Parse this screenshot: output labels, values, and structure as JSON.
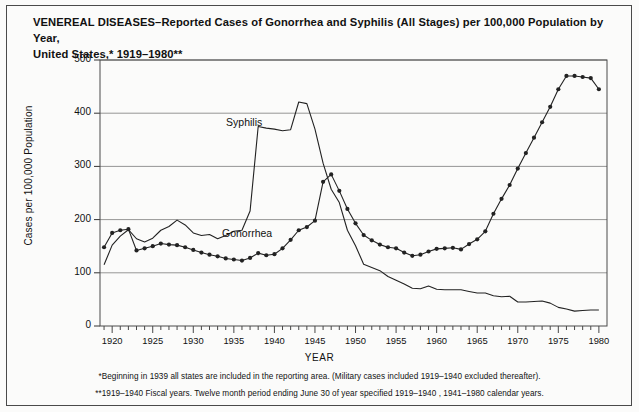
{
  "figure": {
    "title_line1": "VENEREAL DISEASES–Reported Cases of Gonorrhea and Syphilis (All Stages) per 100,000 Population by Year,",
    "title_line2": "United States,* 1919–1980**",
    "footnote1": "*Beginning in 1939 all states are included in the reporting area. (Military cases included 1919–1940 excluded thereafter).",
    "footnote2": "**1919–1940 Fiscal years. Twelve month period ending June 30 of year specified 1919–1940 , 1941–1980 calendar years.",
    "line_color": "#222222",
    "grid_color": "#8a8a8a",
    "frame_color": "#4a4a4a"
  },
  "chart_data": {
    "type": "line",
    "title": "VENEREAL DISEASES–Reported Cases of Gonorrhea and Syphilis (All Stages) per 100,000 Population by Year, United States,* 1919–1980**",
    "xlabel": "YEAR",
    "ylabel": "Cases per 100,000 Population",
    "xlim": [
      1918.5,
      1981
    ],
    "ylim": [
      0,
      500
    ],
    "yticks": [
      0,
      100,
      200,
      300,
      400,
      500
    ],
    "xticks": [
      1920,
      1925,
      1930,
      1935,
      1940,
      1945,
      1950,
      1955,
      1960,
      1965,
      1970,
      1975,
      1980
    ],
    "xtick_minor_step": 1,
    "grid": "horizontal",
    "legend": "inline-annotations",
    "annotations": [
      {
        "text": "Syphilis",
        "x": 1937.0,
        "y": 382
      },
      {
        "text": "Gonorrhea",
        "x": 1936.5,
        "y": 172
      }
    ],
    "x": [
      1919,
      1920,
      1921,
      1922,
      1923,
      1924,
      1925,
      1926,
      1927,
      1928,
      1929,
      1930,
      1931,
      1932,
      1933,
      1934,
      1935,
      1936,
      1937,
      1938,
      1939,
      1940,
      1941,
      1942,
      1943,
      1944,
      1945,
      1946,
      1947,
      1948,
      1949,
      1950,
      1951,
      1952,
      1953,
      1954,
      1955,
      1956,
      1957,
      1958,
      1959,
      1960,
      1961,
      1962,
      1963,
      1964,
      1965,
      1966,
      1967,
      1968,
      1969,
      1970,
      1971,
      1972,
      1973,
      1974,
      1975,
      1976,
      1977,
      1978,
      1979,
      1980
    ],
    "series": [
      {
        "name": "Gonorrhea",
        "marker": "filled-circle",
        "values": [
          148,
          175,
          180,
          182,
          142,
          146,
          150,
          155,
          153,
          152,
          148,
          143,
          138,
          134,
          131,
          127,
          125,
          123,
          128,
          137,
          133,
          135,
          146,
          162,
          180,
          186,
          198,
          271,
          285,
          254,
          220,
          193,
          171,
          161,
          153,
          148,
          146,
          138,
          132,
          134,
          140,
          145,
          146,
          147,
          144,
          154,
          163,
          178,
          211,
          239,
          265,
          296,
          325,
          354,
          383,
          412,
          445,
          470,
          470,
          468,
          466,
          445
        ],
        "style": "line-with-markers"
      },
      {
        "name": "Syphilis",
        "marker": "none",
        "values": [
          115,
          152,
          169,
          181,
          164,
          158,
          165,
          180,
          187,
          199,
          190,
          175,
          170,
          172,
          164,
          170,
          178,
          180,
          216,
          375,
          372,
          370,
          367,
          369,
          421,
          418,
          370,
          306,
          257,
          232,
          180,
          151,
          116,
          110,
          104,
          93,
          86,
          79,
          71,
          70,
          75,
          69,
          68,
          68,
          68,
          65,
          62,
          62,
          57,
          55,
          56,
          45,
          45,
          46,
          47,
          43,
          35,
          32,
          28,
          29,
          30,
          30
        ],
        "style": "line"
      }
    ]
  }
}
